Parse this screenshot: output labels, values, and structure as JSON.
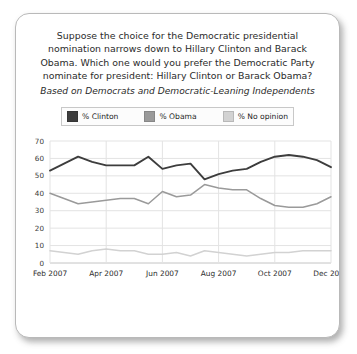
{
  "card": {
    "title_lines": [
      "Suppose the choice for the Democratic presidential",
      "nomination narrows down to Hillary Clinton and Barack",
      "Obama. Which one would you prefer the Democratic Party",
      "nominate for president: Hillary Clinton or Barack Obama?"
    ],
    "subtitle": "Based on Democrats and Democratic-Leaning Independents"
  },
  "legend": {
    "items": [
      {
        "label": "% Clinton",
        "color": "#3d3d3d"
      },
      {
        "label": "% Obama",
        "color": "#9a9a9a"
      },
      {
        "label": "% No opinion",
        "color": "#d2d2d2"
      }
    ]
  },
  "chart_data": {
    "type": "line",
    "subtitle": "Based on Democrats and Democratic-Leaning Independents",
    "xlabel": "",
    "ylabel": "",
    "ylim": [
      0,
      70
    ],
    "yticks": [
      0,
      10,
      20,
      30,
      40,
      50,
      60,
      70
    ],
    "grid": true,
    "legend_position": "top",
    "xtick_labels": [
      "Feb 2007",
      "Apr 2007",
      "Jun 2007",
      "Aug 2007",
      "Oct 2007",
      "Dec 2007"
    ],
    "xtick_index": [
      0,
      4,
      8,
      12,
      16,
      20
    ],
    "x": [
      "Feb 2007",
      "",
      "",
      "",
      "Apr 2007",
      "",
      "",
      "",
      "Jun 2007",
      "",
      "",
      "",
      "Aug 2007",
      "",
      "",
      "",
      "Oct 2007",
      "",
      "",
      "",
      "Dec 2007"
    ],
    "series": [
      {
        "name": "% Clinton",
        "color": "#3d3d3d",
        "values": [
          53,
          57,
          61,
          58,
          56,
          56,
          56,
          61,
          54,
          56,
          57,
          48,
          51,
          53,
          54,
          58,
          61,
          62,
          61,
          59,
          55
        ]
      },
      {
        "name": "% Obama",
        "color": "#9a9a9a",
        "values": [
          40,
          37,
          34,
          35,
          36,
          37,
          37,
          34,
          41,
          38,
          39,
          45,
          43,
          42,
          42,
          37,
          33,
          32,
          32,
          34,
          38
        ]
      },
      {
        "name": "% No opinion",
        "color": "#d2d2d2",
        "values": [
          7,
          6,
          5,
          7,
          8,
          7,
          7,
          5,
          5,
          6,
          4,
          7,
          6,
          5,
          4,
          5,
          6,
          6,
          7,
          7,
          7
        ]
      }
    ]
  }
}
